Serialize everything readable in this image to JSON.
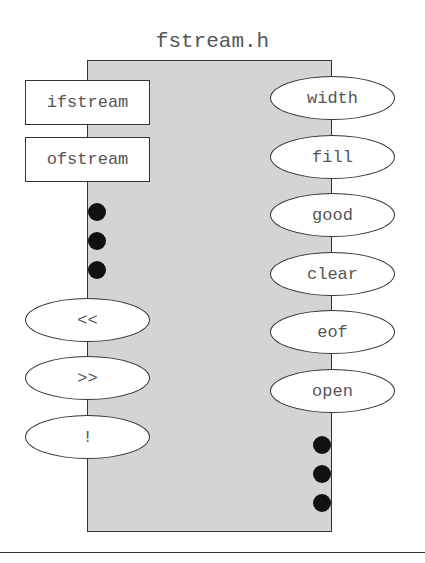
{
  "title": "fstream.h",
  "classes": [
    {
      "label": "ifstream",
      "top": 80
    },
    {
      "label": "ofstream",
      "top": 137
    }
  ],
  "left_operators": [
    {
      "label": "<<",
      "top": 298
    },
    {
      "label": ">>",
      "top": 356
    },
    {
      "label": "!",
      "top": 415
    }
  ],
  "right_methods": [
    {
      "label": "width",
      "top": 76
    },
    {
      "label": "fill",
      "top": 135
    },
    {
      "label": "good",
      "top": 193
    },
    {
      "label": "clear",
      "top": 252
    },
    {
      "label": "eof",
      "top": 310
    },
    {
      "label": "open",
      "top": 369
    }
  ],
  "left_dots_count": 3,
  "right_dots_count": 3
}
